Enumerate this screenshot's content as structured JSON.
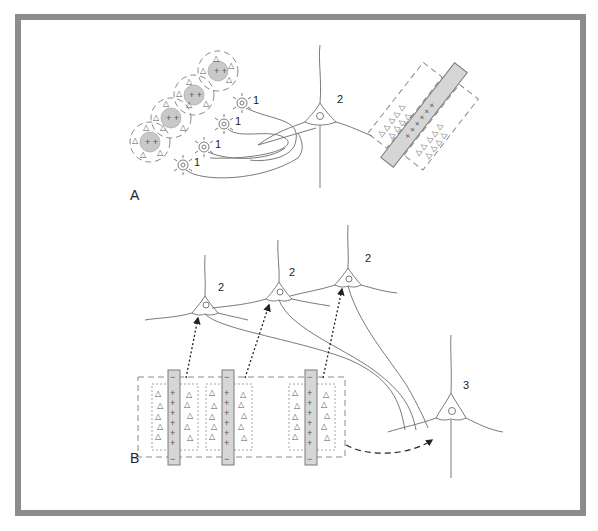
{
  "figure": {
    "panels": [
      {
        "label": "A",
        "description": "Clustered cortical microzones connected to single neuron; patch/strip arrangement"
      },
      {
        "label": "B",
        "description": "Strips projecting to neurons which converge onto a single neuron"
      }
    ],
    "panel_a": {
      "label": "A",
      "neuron_labels_1": [
        "1",
        "1",
        "1",
        "1"
      ],
      "neuron_label_2": "2",
      "clusters": 4
    },
    "panel_b": {
      "label": "B",
      "neuron_labels_2": [
        "2",
        "2",
        "2"
      ],
      "neuron_label_3": "3",
      "strips": 3
    },
    "colors": {
      "frame": "#8c8c8c",
      "fill_gray": "#d6d6d6",
      "line": "#7a7a7a",
      "arrow": "#222222"
    }
  }
}
